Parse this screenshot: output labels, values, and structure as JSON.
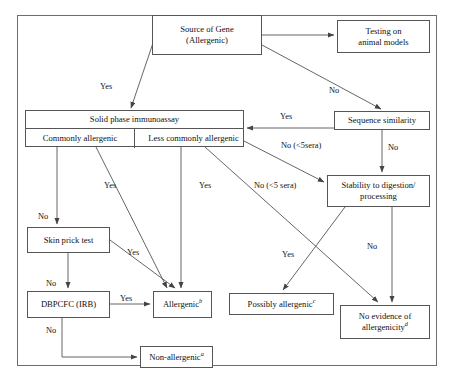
{
  "diagram": {
    "frame_color": "#6e6e6e",
    "box_border_color": "#555555",
    "text_color": "#111111",
    "nodes": {
      "source_of_gene": {
        "line1": "Source of Gene",
        "line2": "(Allergenic)"
      },
      "animal_models": {
        "line1": "Testing on",
        "line2": "animal models"
      },
      "solid_phase": {
        "header": "Solid phase immunoassay",
        "cell_left": "Commonly allergenic",
        "cell_right": "Less commonly allergenic"
      },
      "sequence_similarity": {
        "label": "Sequence similarity"
      },
      "stability": {
        "line1": "Stability to digestion/",
        "line2": "processing"
      },
      "skin_prick": {
        "label": "Skin prick test"
      },
      "dbpcfc": {
        "label": "DBPCFC (IRB)"
      },
      "allergenic": {
        "label": "Allergenic",
        "sup": "b"
      },
      "possibly_allergenic": {
        "label": "Possibly allergenic",
        "sup": "c"
      },
      "no_evidence": {
        "line1": "No evidence of",
        "line2": "allergenicity",
        "sup": "d"
      },
      "non_allergenic": {
        "label": "Non-allergenic",
        "sup": "a"
      }
    },
    "edge_labels": {
      "source_to_solid": "Yes",
      "source_to_sequence": "No",
      "sequence_to_solid": "Yes",
      "sequence_to_stability": "No",
      "commonly_to_skin": "No",
      "commonly_to_allergenic": "Yes",
      "less_commonly_to_allergenic": "Yes",
      "less_commonly_to_stability": "No (<5sera)",
      "less_commonly_to_no_evidence": "No (<5 sera)",
      "skin_to_allergenic": "Yes",
      "skin_to_dbpcfc": "No",
      "dbpcfc_to_allergenic": "Yes",
      "dbpcfc_to_non_allergenic": "No",
      "stability_to_possibly": "Yes",
      "stability_to_no_evidence": "No"
    }
  }
}
